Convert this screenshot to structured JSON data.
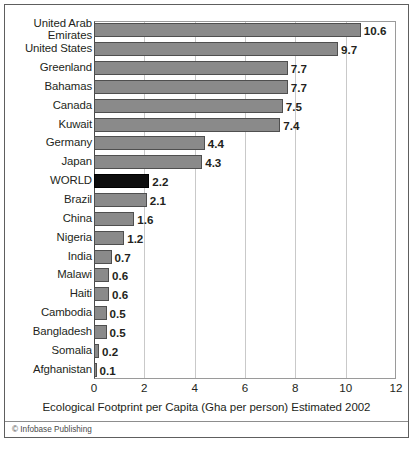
{
  "figure": {
    "credit": "© Infobase Publishing",
    "axis_title": "Ecological Footprint per Capita (Gha per person) Estimated 2002",
    "bar_color": "#8a8a8a",
    "highlight_color": "#0d0d0d"
  },
  "chart_data": {
    "type": "bar",
    "orientation": "horizontal",
    "title": "",
    "subtitle": "",
    "xlabel": "Ecological Footprint per Capita (Gha per person) Estimated 2002",
    "ylabel": "",
    "xlim": [
      0,
      12
    ],
    "xticks": [
      0,
      2,
      4,
      6,
      8,
      10,
      12
    ],
    "xticklabels": [
      "0",
      "2",
      "4",
      "6",
      "8",
      "10",
      "12"
    ],
    "grid": "vertical",
    "legend": "none",
    "highlight_category": "WORLD",
    "categories": [
      "United Arab\nEmirates",
      "United States",
      "Greenland",
      "Bahamas",
      "Canada",
      "Kuwait",
      "Germany",
      "Japan",
      "WORLD",
      "Brazil",
      "China",
      "Nigeria",
      "India",
      "Malawi",
      "Haiti",
      "Cambodia",
      "Bangladesh",
      "Somalia",
      "Afghanistan"
    ],
    "values": [
      10.6,
      9.7,
      7.7,
      7.7,
      7.5,
      7.4,
      4.4,
      4.3,
      2.2,
      2.1,
      1.6,
      1.2,
      0.7,
      0.6,
      0.6,
      0.5,
      0.5,
      0.2,
      0.1
    ],
    "value_labels": [
      "10.6",
      "9.7",
      "7.7",
      "7.7",
      "7.5",
      "7.4",
      "4.4",
      "4.3",
      "2.2",
      "2.1",
      "1.6",
      "1.2",
      "0.7",
      "0.6",
      "0.6",
      "0.5",
      "0.5",
      "0.2",
      "0.1"
    ]
  }
}
